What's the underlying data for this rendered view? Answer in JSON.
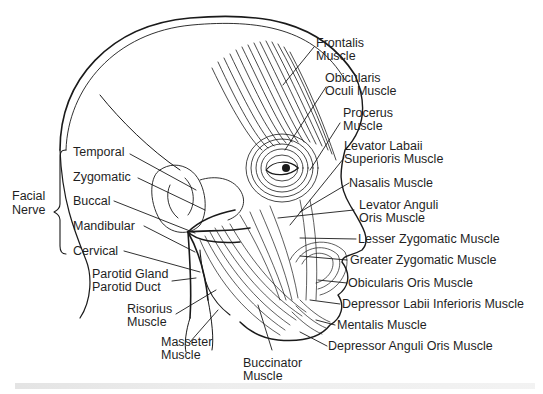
{
  "figure": {
    "group_label": {
      "line1": "Facial",
      "line2": "Nerve"
    },
    "nerve_branches": [
      {
        "label": "Temporal"
      },
      {
        "label": "Zygomatic"
      },
      {
        "label": "Buccal"
      },
      {
        "label": "Mandibular"
      },
      {
        "label": "Cervical"
      }
    ],
    "left_labels": {
      "parotid_gland": "Parotid Gland",
      "parotid_duct": "Parotid Duct",
      "risorius_1": "Risorius",
      "risorius_2": "Muscle",
      "masseter_1": "Masseter",
      "masseter_2": "Muscle",
      "buccinator_1": "Buccinator",
      "buccinator_2": "Muscle"
    },
    "right_labels": {
      "frontalis_1": "Frontalis",
      "frontalis_2": "Muscle",
      "oculi_1": "Obicularis",
      "oculi_2": "Oculi Muscle",
      "procerus_1": "Procerus",
      "procerus_2": "Muscle",
      "lls_1": "Levator Labaii",
      "lls_2": "Superioris Muscle",
      "nasalis": "Nasalis Muscle",
      "lao_1": "Levator Anguli",
      "lao_2": "Oris Muscle",
      "lesser_zyg": "Lesser Zygomatic Muscle",
      "greater_zyg": "Greater Zygomatic Muscle",
      "oris": "Obicularis Oris Muscle",
      "dli": "Depressor Labii Inferioris Muscle",
      "mentalis": "Mentalis Muscle",
      "dao": "Depressor Anguli Oris Muscle"
    },
    "colors": {
      "ink": "#1a1a1a",
      "background": "#ffffff"
    }
  }
}
